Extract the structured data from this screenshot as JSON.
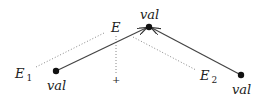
{
  "diagram": {
    "nodes": [
      {
        "id": "top",
        "label": "val"
      },
      {
        "id": "left",
        "label": "val"
      },
      {
        "id": "right",
        "label": "val"
      }
    ],
    "labels": {
      "E": "E",
      "E1_base": "E",
      "E1_sub": "1",
      "E2_base": "E",
      "E2_sub": "2",
      "plus": "+"
    },
    "edges": [
      {
        "from": "left",
        "to": "top",
        "style": "solid-arrow"
      },
      {
        "from": "right",
        "to": "top",
        "style": "solid-arrow"
      },
      {
        "from": "E1",
        "to": "E",
        "style": "dotted"
      },
      {
        "from": "E",
        "to": "plus",
        "style": "dotted"
      },
      {
        "from": "E",
        "to": "E2",
        "style": "dotted"
      }
    ]
  }
}
